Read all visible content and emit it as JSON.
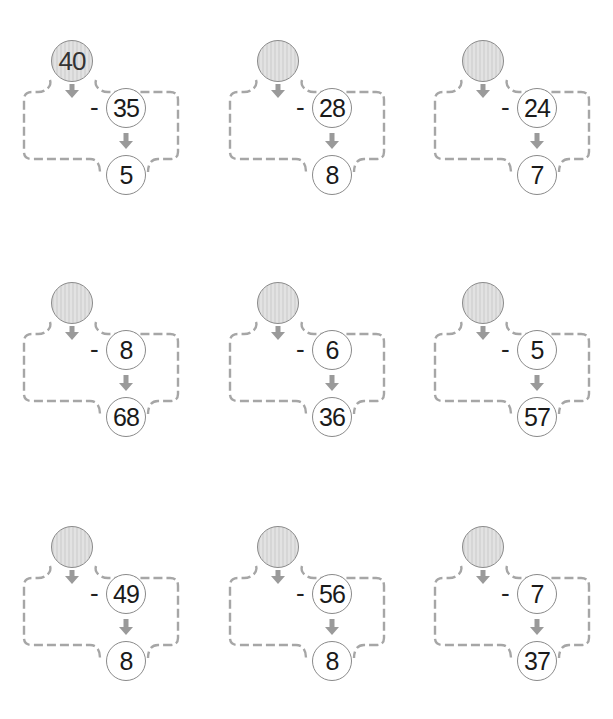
{
  "worksheet": {
    "operator": "-",
    "colors": {
      "frame_dash": "#a6a6a6",
      "frame_dash_alt": "#c9b8b8",
      "arrow": "#9a9a9a",
      "top_circle_fill": "#dcdcdc",
      "circle_border": "#8a8a8a"
    },
    "problems": [
      {
        "start": "40",
        "subtract": "35",
        "result": "5"
      },
      {
        "start": "",
        "subtract": "28",
        "result": "8"
      },
      {
        "start": "",
        "subtract": "24",
        "result": "7"
      },
      {
        "start": "",
        "subtract": "8",
        "result": "68"
      },
      {
        "start": "",
        "subtract": "6",
        "result": "36"
      },
      {
        "start": "",
        "subtract": "5",
        "result": "57"
      },
      {
        "start": "",
        "subtract": "49",
        "result": "8"
      },
      {
        "start": "",
        "subtract": "56",
        "result": "8"
      },
      {
        "start": "",
        "subtract": "7",
        "result": "37"
      }
    ]
  }
}
